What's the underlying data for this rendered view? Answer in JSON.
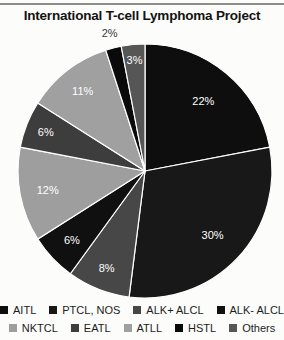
{
  "title": "International T-cell Lymphoma Project",
  "colors": {
    "background": "#fcfcfa",
    "top_rule": "#8c8c8c",
    "title_text": "#131313",
    "legend_text": "#1b1b1b",
    "slice_separator": "#ffffff",
    "inside_label_text": "#ffffff",
    "outside_label_text": "#3a3a3a"
  },
  "chart_data": {
    "type": "pie",
    "title": "International T-cell Lymphoma Project",
    "start_angle_deg": 0,
    "direction": "clockwise",
    "legend_position": "bottom",
    "slices": [
      {
        "label": "AITL",
        "value": 22,
        "pct_label": "22%",
        "color": "#0e0e0e",
        "label_radius": 0.72,
        "label_placement": "inside"
      },
      {
        "label": "PTCL, NOS",
        "value": 30,
        "pct_label": "30%",
        "color": "#181818",
        "label_radius": 0.73,
        "label_placement": "inside"
      },
      {
        "label": "ALK+ ALCL",
        "value": 8,
        "pct_label": "8%",
        "color": "#474747",
        "label_radius": 0.82,
        "label_placement": "inside"
      },
      {
        "label": "ALK- ALCL",
        "value": 6,
        "pct_label": "6%",
        "color": "#101010",
        "label_radius": 0.79,
        "label_placement": "inside"
      },
      {
        "label": "NKTCL",
        "value": 12,
        "pct_label": "12%",
        "color": "#9e9e9e",
        "label_radius": 0.78,
        "label_placement": "inside"
      },
      {
        "label": "EATL",
        "value": 6,
        "pct_label": "6%",
        "color": "#3d3d3d",
        "label_radius": 0.84,
        "label_placement": "inside"
      },
      {
        "label": "ATLL",
        "value": 11,
        "pct_label": "11%",
        "color": "#a0a0a0",
        "label_radius": 0.8,
        "label_placement": "inside"
      },
      {
        "label": "HSTL",
        "value": 2,
        "pct_label": "2%",
        "color": "#0a0a0a",
        "label_radius": 1.12,
        "label_placement": "outside"
      },
      {
        "label": "Others",
        "value": 3,
        "pct_label": "3%",
        "color": "#565656",
        "label_radius": 0.88,
        "label_placement": "inside"
      }
    ],
    "legend_rows": [
      [
        "AITL",
        "PTCL, NOS",
        "ALK+ ALCL",
        "ALK- ALCL"
      ],
      [
        "NKTCL",
        "EATL",
        "ATLL",
        "HSTL",
        "Others"
      ]
    ]
  }
}
